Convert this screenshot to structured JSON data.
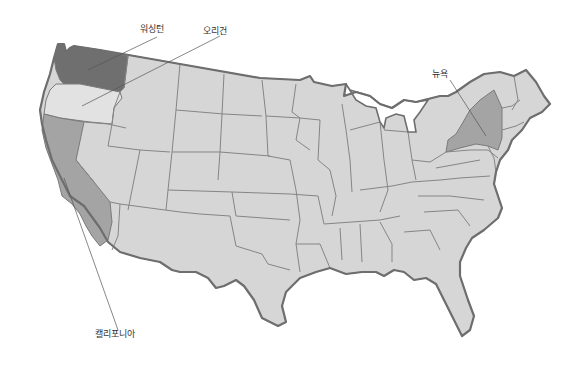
{
  "map": {
    "title": "미국 지도",
    "colors": {
      "base_state": "#d6d6d6",
      "washington": "#6f6f6f",
      "california": "#a4a4a4",
      "new_york": "#a4a4a4",
      "oregon": "#e2e2e2",
      "border": "#6e6e6e",
      "background": "#ffffff"
    },
    "highlighted_states": [
      {
        "id": "washington",
        "label": "워싱턴",
        "shade": "dark"
      },
      {
        "id": "oregon",
        "label": "오리건",
        "shade": "light"
      },
      {
        "id": "california",
        "label": "캘리포니아",
        "shade": "medium"
      },
      {
        "id": "new_york",
        "label": "뉴욕",
        "shade": "medium"
      }
    ]
  },
  "labels": {
    "washington": "워싱턴",
    "oregon": "오리건",
    "california": "캘리포니아",
    "new_york": "뉴욕"
  }
}
